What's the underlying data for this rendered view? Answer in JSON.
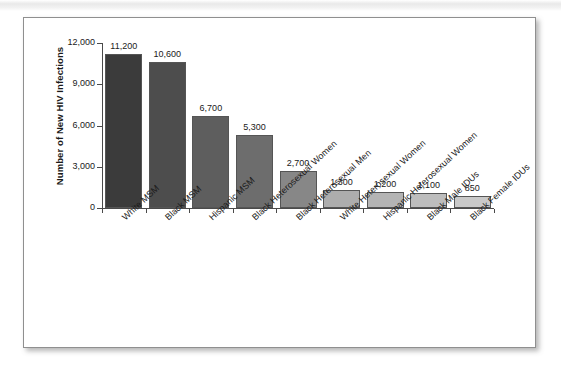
{
  "figure": {
    "panel_label": "",
    "background_color": "#ffffff",
    "border_color": "#8f8f8f"
  },
  "chart_data": {
    "type": "bar",
    "title": "",
    "xlabel": "",
    "ylabel": "Number of New HIV Infections",
    "ylim": [
      0,
      12000
    ],
    "ytick_labels": [
      "0",
      "3,000",
      "6,000",
      "9,000",
      "12,000"
    ],
    "ytick_values": [
      0,
      3000,
      6000,
      9000,
      12000
    ],
    "grid": false,
    "legend": null,
    "categories": [
      "White MSM",
      "Black MSM",
      "Hispanic MSM",
      "Black Heterosexual Women",
      "Black Heterosexual Men",
      "White Heterosexual Women",
      "Hispanic Heterosexual Women",
      "Black Male IDUs",
      "Black Female IDUs"
    ],
    "values": [
      11200,
      10600,
      6700,
      5300,
      2700,
      1300,
      1200,
      1100,
      850
    ],
    "value_labels": [
      "11,200",
      "10,600",
      "6,700",
      "5,300",
      "2,700",
      "1,300",
      "1,200",
      "1,100",
      "850"
    ],
    "bar_colors": [
      "#3b3b3b",
      "#4d4d4d",
      "#5e5e5e",
      "#6d6d6d",
      "#878787",
      "#adadad",
      "#b4b4b4",
      "#bdbdbd",
      "#c9c9c9"
    ],
    "bar_edge_color": "#555555",
    "axis_color": "#4a4a4a"
  }
}
